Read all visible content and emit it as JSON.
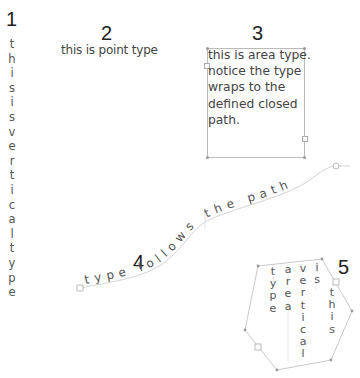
{
  "examples": [
    {
      "number": "1",
      "kind": "vertical-type",
      "text": "this is vertical type"
    },
    {
      "number": "2",
      "kind": "point-type",
      "text": "this is point type"
    },
    {
      "number": "3",
      "kind": "area-type",
      "lines": [
        "this is area type.",
        "notice the type",
        "wraps to the",
        "defined closed",
        "path."
      ]
    },
    {
      "number": "4",
      "kind": "type-on-path",
      "text": "type follows the path"
    },
    {
      "number": "5",
      "kind": "vertical-area-type",
      "columns": [
        "type",
        "area",
        "vertical",
        "is",
        "this"
      ]
    }
  ],
  "labels": {
    "n1": "1",
    "n2": "2",
    "n3": "3",
    "n4": "4",
    "n5": "5",
    "point": "this is point type",
    "area": {
      "l1": "this is area type.",
      "l2": "notice the type",
      "l3": "wraps to the",
      "l4": "defined closed",
      "l5": "path."
    },
    "path_text": "type follows the path"
  },
  "vertical1": [
    "t",
    "h",
    "i",
    "s",
    "i",
    "s",
    "v",
    "e",
    "r",
    "t",
    "i",
    "c",
    "a",
    "l",
    "t",
    "y",
    "p",
    "e"
  ],
  "vcols5": {
    "c1": [
      "t",
      "y",
      "p",
      "e"
    ],
    "c2": [
      "a",
      "r",
      "e",
      "a"
    ],
    "c3": [
      "v",
      "e",
      "r",
      "t",
      "i",
      "c",
      "a",
      "l"
    ],
    "c4": [
      "i",
      "s"
    ],
    "c5": [
      "t",
      "h",
      "i",
      "s"
    ]
  },
  "colors": {
    "text": "#444444",
    "path": "#bbbbbb",
    "number": "#222222"
  }
}
